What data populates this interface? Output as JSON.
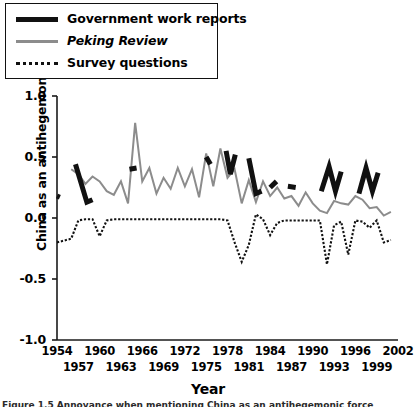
{
  "figure": {
    "xlabel": "Year",
    "ylabel": "China as an antihegemonic force*",
    "caption": "Figure 1.5   Annoyance when mentioning China as an antihegemonic force"
  },
  "legend": {
    "position": "top-left",
    "items": [
      {
        "label": "Government work reports",
        "style": "solid-thick",
        "color": "#111111",
        "name": "government-work-reports"
      },
      {
        "label": "Peking Review",
        "style": "solid-gray",
        "color": "#8c8c8c",
        "name": "peking-review",
        "italic": true
      },
      {
        "label": "Survey questions",
        "style": "dotted",
        "color": "#111111",
        "name": "survey-questions"
      }
    ]
  },
  "axes": {
    "y_ticks": [
      "1.0",
      "0.5",
      "0.0",
      "-0.5",
      "-1.0"
    ],
    "y_tick_values": [
      1.0,
      0.5,
      0.0,
      -0.5,
      -1.0
    ],
    "ylim": [
      -1.0,
      1.0
    ],
    "xlim": [
      1954,
      2002
    ],
    "x_ticks_top": [
      "1954",
      "1960",
      "1966",
      "1972",
      "1978",
      "1984",
      "1990",
      "1996",
      "2002"
    ],
    "x_ticks_bottom": [
      "1957",
      "1963",
      "1969",
      "1975",
      "1981",
      "1987",
      "1993",
      "1999"
    ],
    "x_tick_values_top": [
      1954,
      1960,
      1966,
      1972,
      1978,
      1984,
      1990,
      1996,
      2002
    ],
    "x_tick_values_bottom": [
      1957,
      1963,
      1969,
      1975,
      1981,
      1987,
      1993,
      1999
    ],
    "grid": false
  },
  "chart_data": {
    "type": "line",
    "title": "",
    "xlabel": "Year",
    "ylabel": "China as an antihegemonic force*",
    "xlim": [
      1954,
      2002
    ],
    "ylim": [
      -1.0,
      1.0
    ],
    "grid": false,
    "legend_position": "top-left",
    "series": [
      {
        "name": "Government work reports",
        "color": "#111111",
        "style": "solid-thick",
        "segments": [
          {
            "x": [
              1954,
              1954.4
            ],
            "y": [
              0.18,
              0.17
            ]
          },
          {
            "x": [
              1956.6,
              1958.2,
              1959.0
            ],
            "y": [
              0.44,
              0.13,
              0.15
            ]
          },
          {
            "x": [
              1964.2,
              1965.2
            ],
            "y": [
              0.4,
              0.41
            ]
          },
          {
            "x": [
              1975.0,
              1975.6
            ],
            "y": [
              0.5,
              0.44
            ]
          },
          {
            "x": [
              1977.8,
              1978.4,
              1979.1
            ],
            "y": [
              0.55,
              0.36,
              0.52
            ]
          },
          {
            "x": [
              1981.0,
              1982.0,
              1982.8
            ],
            "y": [
              0.49,
              0.2,
              0.22
            ]
          },
          {
            "x": [
              1984.0,
              1984.9
            ],
            "y": [
              0.25,
              0.3
            ]
          },
          {
            "x": [
              1986.5,
              1987.6
            ],
            "y": [
              0.26,
              0.25
            ]
          },
          {
            "x": [
              1991.2,
              1992.3,
              1993.2,
              1994.0
            ],
            "y": [
              0.22,
              0.42,
              0.22,
              0.38
            ]
          },
          {
            "x": [
              1996.5,
              1997.5,
              1998.4,
              1999.2
            ],
            "y": [
              0.2,
              0.41,
              0.22,
              0.37
            ]
          }
        ]
      },
      {
        "name": "Peking Review",
        "color": "#8c8c8c",
        "style": "solid-thin",
        "x": [
          1956,
          1957,
          1958,
          1959,
          1960,
          1961,
          1962,
          1963,
          1964,
          1965,
          1966,
          1967,
          1968,
          1969,
          1970,
          1971,
          1972,
          1973,
          1974,
          1975,
          1976,
          1977,
          1978,
          1979,
          1980,
          1981,
          1982,
          1983,
          1984,
          1985,
          1986,
          1987,
          1988,
          1989,
          1990,
          1991,
          1992,
          1993,
          1994,
          1995,
          1996,
          1997,
          1998,
          1999,
          2000,
          2001
        ],
        "y": [
          0.4,
          0.36,
          0.28,
          0.34,
          0.3,
          0.22,
          0.19,
          0.3,
          0.12,
          0.78,
          0.3,
          0.41,
          0.2,
          0.33,
          0.24,
          0.41,
          0.26,
          0.4,
          0.17,
          0.53,
          0.26,
          0.57,
          0.33,
          0.4,
          0.12,
          0.31,
          0.13,
          0.3,
          0.18,
          0.25,
          0.16,
          0.18,
          0.1,
          0.21,
          0.12,
          0.06,
          0.04,
          0.14,
          0.12,
          0.11,
          0.18,
          0.15,
          0.08,
          0.09,
          0.02,
          0.05
        ]
      },
      {
        "name": "Survey questions",
        "color": "#111111",
        "style": "dotted",
        "x": [
          1954,
          1956,
          1957,
          1958,
          1959,
          1960,
          1961,
          1962,
          1963,
          1964,
          1965,
          1966,
          1967,
          1968,
          1969,
          1970,
          1971,
          1972,
          1973,
          1974,
          1975,
          1976,
          1977,
          1978,
          1979,
          1980,
          1981,
          1982,
          1983,
          1984,
          1985,
          1986,
          1987,
          1988,
          1989,
          1990,
          1991,
          1992,
          1993,
          1994,
          1995,
          1996,
          1997,
          1998,
          1999,
          2000,
          2001
        ],
        "y": [
          -0.2,
          -0.17,
          -0.02,
          -0.01,
          -0.01,
          -0.15,
          -0.02,
          -0.01,
          -0.01,
          -0.01,
          -0.01,
          -0.01,
          -0.01,
          -0.01,
          -0.01,
          -0.01,
          -0.01,
          -0.01,
          -0.01,
          -0.01,
          -0.01,
          -0.01,
          -0.01,
          -0.02,
          -0.2,
          -0.36,
          -0.22,
          0.03,
          -0.01,
          -0.14,
          -0.04,
          -0.02,
          -0.02,
          -0.02,
          -0.02,
          -0.02,
          -0.02,
          -0.38,
          -0.06,
          -0.03,
          -0.3,
          -0.02,
          -0.03,
          -0.08,
          -0.02,
          -0.2,
          -0.18
        ]
      }
    ]
  }
}
